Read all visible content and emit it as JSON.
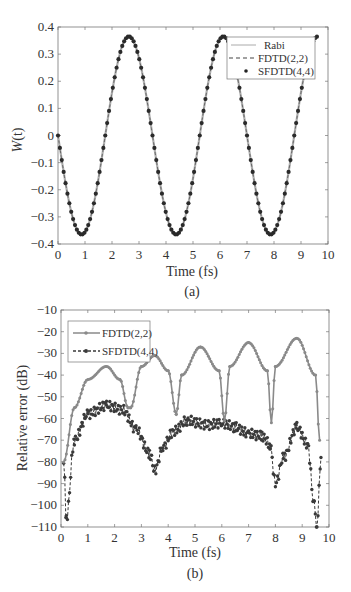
{
  "chart_data": [
    {
      "type": "line",
      "panel": "(a)",
      "title": "",
      "xlabel": "Time (fs)",
      "ylabel": "W(t)",
      "xlim": [
        0,
        10
      ],
      "ylim": [
        -0.4,
        0.4
      ],
      "xticks": [
        0,
        1,
        2,
        3,
        4,
        5,
        6,
        7,
        8,
        9,
        10
      ],
      "yticks": [
        -0.4,
        -0.3,
        -0.2,
        -0.1,
        0,
        0.1,
        0.2,
        0.3,
        0.4
      ],
      "xtick_labels": [
        "0",
        "1",
        "2",
        "3",
        "4",
        "5",
        "6",
        "7",
        "8",
        "9",
        "10"
      ],
      "ytick_labels": [
        "−0.4",
        "−0.3",
        "−0.2",
        "−0.1",
        "0",
        "0.1",
        "0.2",
        "0.3",
        "0.4"
      ],
      "grid": false,
      "legend_position": "upper right",
      "legend": [
        "Rabi",
        "FDTD(2,2)",
        "SFDTD(4,4)"
      ],
      "series": [
        {
          "name": "Rabi",
          "style": "solid",
          "color": "#b0b0b0",
          "amplitude": 0.365,
          "period_fs": 3.5,
          "phase": "starts at 0 going negative, minima at 0.875, 4.375, 7.875; maxima at 2.625, 6.125, 9.625"
        },
        {
          "name": "FDTD(2,2)",
          "style": "dashed",
          "color": "#555555"
        },
        {
          "name": "SFDTD(4,4)",
          "style": "dots",
          "color": "#2a2a2a"
        }
      ],
      "x": [
        0,
        0.875,
        1.75,
        2.625,
        3.5,
        4.375,
        5.25,
        6.125,
        7.0,
        7.875,
        8.75,
        9.625
      ],
      "values": [
        0,
        -0.365,
        0,
        0.365,
        0,
        -0.365,
        0,
        0.365,
        0,
        -0.365,
        0,
        0.365
      ]
    },
    {
      "type": "line",
      "panel": "(b)",
      "title": "",
      "xlabel": "Time (fs)",
      "ylabel": "Relative error (dB)",
      "xlim": [
        0,
        10
      ],
      "ylim": [
        -110,
        -10
      ],
      "xticks": [
        0,
        1,
        2,
        3,
        4,
        5,
        6,
        7,
        8,
        9,
        10
      ],
      "yticks": [
        -110,
        -100,
        -90,
        -80,
        -70,
        -60,
        -50,
        -40,
        -30,
        -20,
        -10
      ],
      "xtick_labels": [
        "0",
        "1",
        "2",
        "3",
        "4",
        "5",
        "6",
        "7",
        "8",
        "9",
        "10"
      ],
      "ytick_labels": [
        "−110",
        "−100",
        "−90",
        "−80",
        "−70",
        "−60",
        "−50",
        "−40",
        "−30",
        "−20",
        "−10"
      ],
      "grid": false,
      "legend_position": "upper left",
      "legend": [
        "FDTD(2,2)",
        "SFDTD(4,4)"
      ],
      "series": [
        {
          "name": "FDTD(2,2)",
          "style": "solid with markers",
          "color": "#8a8a8a",
          "x": [
            0.1,
            0.5,
            1.0,
            1.7,
            2.2,
            2.5,
            2.6,
            3.0,
            3.5,
            4.0,
            4.3,
            4.5,
            5.2,
            5.9,
            6.1,
            6.3,
            7.0,
            7.7,
            7.85,
            8.0,
            8.8,
            9.5,
            9.65
          ],
          "values": [
            -80,
            -55,
            -42,
            -36,
            -42,
            -55,
            -55,
            -36,
            -31,
            -38,
            -58,
            -40,
            -27,
            -38,
            -61,
            -36,
            -25,
            -38,
            -62,
            -36,
            -23,
            -40,
            -70
          ]
        },
        {
          "name": "SFDTD(4,4)",
          "style": "dashed with markers",
          "color": "#3a3a3a",
          "x": [
            0.1,
            0.2,
            0.5,
            1.0,
            1.7,
            2.3,
            2.8,
            3.3,
            3.5,
            3.8,
            4.2,
            4.7,
            5.5,
            6.0,
            6.5,
            7.0,
            7.5,
            7.8,
            8.0,
            8.3,
            8.8,
            9.2,
            9.45,
            9.55,
            9.7
          ],
          "values": [
            -80,
            -106,
            -70,
            -58,
            -54,
            -56,
            -65,
            -76,
            -84,
            -73,
            -66,
            -61,
            -63,
            -62,
            -64,
            -67,
            -68,
            -72,
            -90,
            -78,
            -64,
            -72,
            -100,
            -110,
            -78
          ]
        }
      ]
    }
  ],
  "panels": {
    "a": {
      "caption": "(a)",
      "xlabel": "Time (fs)",
      "ylabel_main": "W",
      "ylabel_arg": "(t)",
      "legend": {
        "items": [
          "Rabi",
          "FDTD(2,2)",
          "SFDTD(4,4)"
        ]
      }
    },
    "b": {
      "caption": "(b)",
      "xlabel": "Time (fs)",
      "ylabel": "Relative error (dB)",
      "legend": {
        "items": [
          "FDTD(2,2)",
          "SFDTD(4,4)"
        ]
      }
    }
  }
}
